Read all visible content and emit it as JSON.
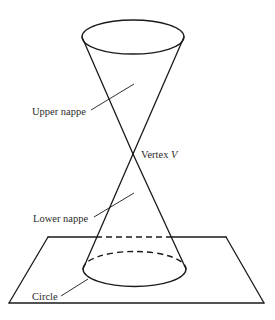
{
  "diagram": {
    "type": "double-napped cone intersected by a plane",
    "labels": {
      "upper_nappe": "Upper nappe",
      "vertex_prefix": "Vertex ",
      "vertex_symbol": "V",
      "lower_nappe": "Lower nappe",
      "circle": "Circle"
    },
    "colors": {
      "line": "#1a1a1a",
      "text": "#2a2a2a",
      "background": "#ffffff"
    }
  }
}
